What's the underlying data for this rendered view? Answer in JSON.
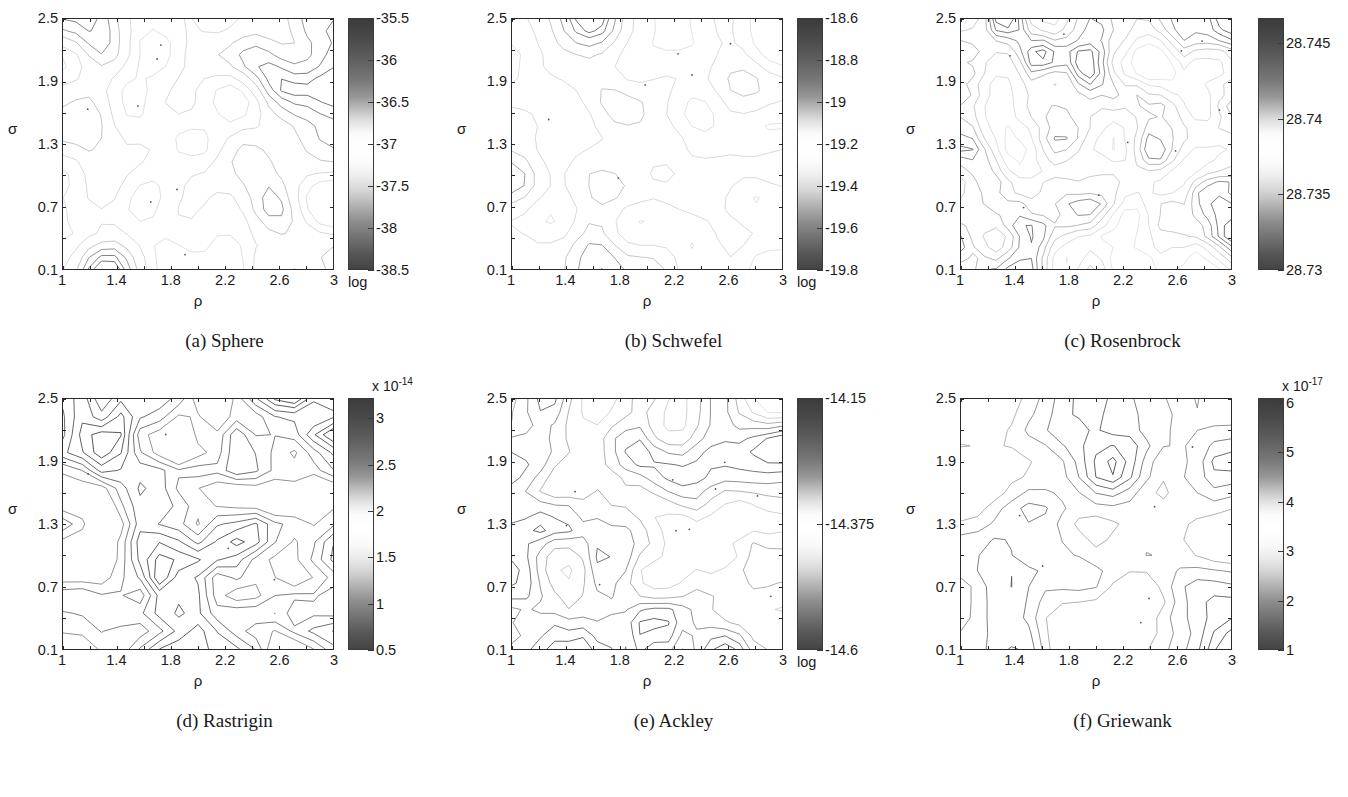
{
  "figure": {
    "axis_x_label": "ρ",
    "axis_y_label": "σ",
    "log_tag": "log"
  },
  "panels": [
    {
      "id": "sphere",
      "caption": "(a) Sphere",
      "xticks": [
        "1",
        "1.4",
        "1.8",
        "2.2",
        "2.6",
        "3"
      ],
      "yticks": [
        "0.1",
        "0.7",
        "1.3",
        "1.9",
        "2.5"
      ],
      "xlabel": "ρ",
      "ylabel": "σ",
      "colorbar": {
        "ticks": [
          "-35.5",
          "-36",
          "-36.5",
          "-37",
          "-37.5",
          "-38",
          "-38.5"
        ],
        "multiplier": "",
        "log_label": "log",
        "min": -38.5,
        "max": -35.5
      }
    },
    {
      "id": "schwefel",
      "caption": "(b) Schwefel",
      "xticks": [
        "1",
        "1.4",
        "1.8",
        "2.2",
        "2.6",
        "3"
      ],
      "yticks": [
        "0.1",
        "0.7",
        "1.3",
        "1.9",
        "2.5"
      ],
      "xlabel": "ρ",
      "ylabel": "σ",
      "colorbar": {
        "ticks": [
          "-18.6",
          "-18.8",
          "-19",
          "-19.2",
          "-19.4",
          "-19.6",
          "-19.8"
        ],
        "multiplier": "",
        "log_label": "log",
        "min": -19.8,
        "max": -18.6
      }
    },
    {
      "id": "rosenbrock",
      "caption": "(c) Rosenbrock",
      "xticks": [
        "1",
        "1.4",
        "1.8",
        "2.2",
        "2.6",
        "3"
      ],
      "yticks": [
        "0.1",
        "0.7",
        "1.3",
        "1.9",
        "2.5"
      ],
      "xlabel": "ρ",
      "ylabel": "σ",
      "colorbar": {
        "ticks": [
          "28.745",
          "28.74",
          "28.735",
          "28.73"
        ],
        "multiplier": "",
        "log_label": "",
        "min": 28.73,
        "max": 28.7475
      }
    },
    {
      "id": "rastrigin",
      "caption": "(d) Rastrigin",
      "xticks": [
        "1",
        "1.4",
        "1.8",
        "2.2",
        "2.6",
        "3"
      ],
      "yticks": [
        "0.1",
        "0.7",
        "1.3",
        "1.9",
        "2.5"
      ],
      "xlabel": "ρ",
      "ylabel": "σ",
      "colorbar": {
        "ticks": [
          "3",
          "2.5",
          "2",
          "1.5",
          "1",
          "0.5"
        ],
        "multiplier": "x 10",
        "exponent": "-14",
        "log_label": "",
        "min": 0.5,
        "max": 3.3
      }
    },
    {
      "id": "ackley",
      "caption": "(e) Ackley",
      "xticks": [
        "1",
        "1.4",
        "1.8",
        "2.2",
        "2.6",
        "3"
      ],
      "yticks": [
        "0.1",
        "0.7",
        "1.3",
        "1.9",
        "2.5"
      ],
      "xlabel": "ρ",
      "ylabel": "σ",
      "colorbar": {
        "ticks": [
          "-14.15",
          "-14.375",
          "-14.6"
        ],
        "multiplier": "",
        "log_label": "log",
        "min": -14.6,
        "max": -14.15
      }
    },
    {
      "id": "griewank",
      "caption": "(f) Griewank",
      "xticks": [
        "1",
        "1.4",
        "1.8",
        "2.2",
        "2.6",
        "3"
      ],
      "yticks": [
        "0.1",
        "0.7",
        "1.3",
        "1.9",
        "2.5"
      ],
      "xlabel": "ρ",
      "ylabel": "σ",
      "colorbar": {
        "ticks": [
          "6",
          "5",
          "4",
          "3",
          "2",
          "1"
        ],
        "multiplier": "x 10",
        "exponent": "-17",
        "log_label": "",
        "min": 1,
        "max": 6
      }
    }
  ],
  "chart_data": {
    "type": "heatmap",
    "subtype": "contour",
    "panel_count": 6,
    "shared_axes": {
      "x": {
        "label": "ρ",
        "range": [
          1,
          3
        ],
        "ticks": [
          1,
          1.4,
          1.8,
          2.2,
          2.6,
          3
        ]
      },
      "y": {
        "label": "σ",
        "range": [
          0.1,
          2.5
        ],
        "ticks": [
          0.1,
          0.7,
          1.3,
          1.9,
          2.5
        ]
      }
    },
    "grid": false,
    "legend": "colorbar-right-of-each-panel",
    "colormap": "grayscale-diverging (dark at extremes, white mid)",
    "panels": [
      {
        "label": "(a) Sphere",
        "zlabel": "log",
        "zrange": [
          -38.5,
          -35.5
        ],
        "ztick_step": 0.5,
        "density": "sparse",
        "description": "mostly flat white field with a few small closed contour islands"
      },
      {
        "label": "(b) Schwefel",
        "zlabel": "log",
        "zrange": [
          -19.8,
          -18.6
        ],
        "ztick_step": 0.2,
        "density": "sparse",
        "description": "faint background contours with several elongated closed loops"
      },
      {
        "label": "(c) Rosenbrock",
        "zlabel": "",
        "zrange": [
          28.73,
          28.7475
        ],
        "ztick_step": 0.005,
        "density": "medium",
        "description": "many small nested diamond islands spread across the field"
      },
      {
        "label": "(d) Rastrigin",
        "zlabel": "",
        "zrange": [
          5e-15,
          3.3e-14
        ],
        "ztick_step": 5e-15,
        "multiplier": 1e-14,
        "density": "dense",
        "description": "large irregular polygonal contour cells filling the whole panel"
      },
      {
        "label": "(e) Ackley",
        "zlabel": "log",
        "zrange": [
          -14.6,
          -14.15
        ],
        "ztick_step": 0.225,
        "density": "medium",
        "description": "nested polygonal peaks with center dots, diagonal banding"
      },
      {
        "label": "(f) Griewank",
        "zlabel": "",
        "zrange": [
          1e-17,
          6e-17
        ],
        "ztick_step": 1e-17,
        "multiplier": 1e-17,
        "density": "medium",
        "description": "clusters of nested diamonds, strongest near sigma 0.9 and rho 1.4"
      }
    ]
  }
}
